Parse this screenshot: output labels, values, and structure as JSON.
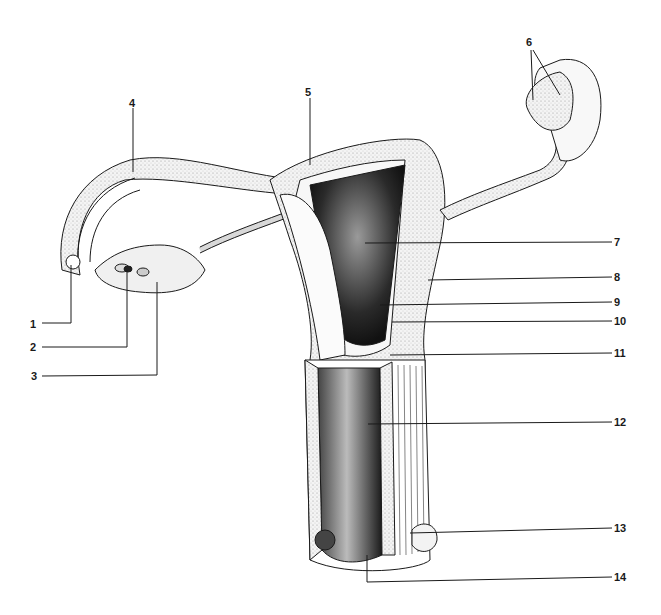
{
  "diagram": {
    "title": "",
    "background": "#ffffff",
    "ink_color": "#1a1a1a",
    "labels": [
      {
        "id": "1",
        "text": "1",
        "x": 30,
        "y": 318
      },
      {
        "id": "2",
        "text": "2",
        "x": 30,
        "y": 341
      },
      {
        "id": "3",
        "text": "3",
        "x": 31,
        "y": 370
      },
      {
        "id": "4",
        "text": "4",
        "x": 129,
        "y": 97
      },
      {
        "id": "5",
        "text": "5",
        "x": 305,
        "y": 86
      },
      {
        "id": "6",
        "text": "6",
        "x": 526,
        "y": 36
      },
      {
        "id": "7",
        "text": "7",
        "x": 614,
        "y": 236
      },
      {
        "id": "8",
        "text": "8",
        "x": 614,
        "y": 271
      },
      {
        "id": "9",
        "text": "9",
        "x": 614,
        "y": 296
      },
      {
        "id": "10",
        "text": "10",
        "x": 614,
        "y": 315
      },
      {
        "id": "11",
        "text": "11",
        "x": 614,
        "y": 347
      },
      {
        "id": "12",
        "text": "12",
        "x": 614,
        "y": 416
      },
      {
        "id": "13",
        "text": "13",
        "x": 614,
        "y": 522
      },
      {
        "id": "14",
        "text": "14",
        "x": 614,
        "y": 571
      }
    ]
  }
}
